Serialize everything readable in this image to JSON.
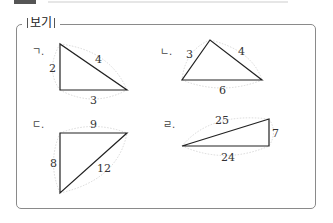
{
  "header": {
    "box_title": "보기"
  },
  "items": [
    {
      "label": "ㄱ.",
      "sides": [
        "2",
        "4",
        "3"
      ]
    },
    {
      "label": "ㄴ.",
      "sides": [
        "3",
        "4",
        "6"
      ]
    },
    {
      "label": "ㄷ.",
      "sides": [
        "9",
        "8",
        "12"
      ]
    },
    {
      "label": "ㄹ.",
      "sides": [
        "25",
        "7",
        "24"
      ]
    }
  ],
  "colors": {
    "border": "#8a8a8a",
    "triangle_stroke": "#222222",
    "arc_stroke": "#c8c8c8"
  }
}
